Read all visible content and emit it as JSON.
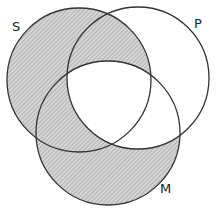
{
  "diagram": {
    "type": "venn-3-set",
    "sets": [
      {
        "id": "S",
        "label": "S",
        "cx": 79,
        "cy": 80,
        "r": 72
      },
      {
        "id": "P",
        "label": "P",
        "cx": 138,
        "cy": 78,
        "r": 71
      },
      {
        "id": "M",
        "label": "M",
        "cx": 108,
        "cy": 133,
        "r": 72
      }
    ],
    "shaded_regions": [
      "S only",
      "S and P not M",
      "S and M not P",
      "M only"
    ],
    "unshaded_regions": [
      "P only",
      "P and M not S",
      "S and P and M"
    ],
    "colors": {
      "stroke": "#333333",
      "shade": "#bdbdbd",
      "background": "#ffffff"
    }
  },
  "labels": {
    "s": "S",
    "p": "P",
    "m": "M"
  }
}
